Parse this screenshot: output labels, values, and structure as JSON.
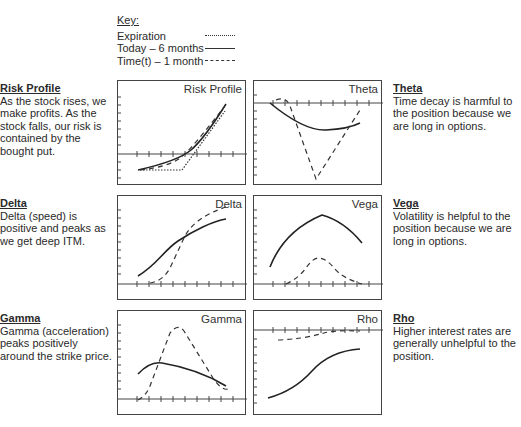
{
  "key": {
    "title": "Key:",
    "items": [
      {
        "label": "Expiration",
        "style": "dotted"
      },
      {
        "label": "Today – 6 months",
        "style": "solid"
      },
      {
        "label": "Time(t) – 1 month",
        "style": "dashed"
      }
    ]
  },
  "descriptions": {
    "risk_profile": {
      "title": "Risk Profile",
      "text": "As the stock rises, we make profits. As the stock falls, our risk is contained by the bought put."
    },
    "delta": {
      "title": "Delta",
      "text": "Delta (speed) is positive and peaks as we get deep ITM."
    },
    "gamma": {
      "title": "Gamma",
      "text": "Gamma (acceleration) peaks positively around the strike price."
    },
    "theta": {
      "title": "Theta",
      "text": "Time decay is harmful to the position because we are long in options."
    },
    "vega": {
      "title": "Vega",
      "text": "Volatility is helpful to the position because we are long in options."
    },
    "rho": {
      "title": "Rho",
      "text": "Higher interest rates are generally unhelpful to the position."
    }
  },
  "panels": {
    "risk_profile": {
      "label": "Risk Profile"
    },
    "theta": {
      "label": "Theta"
    },
    "delta": {
      "label": "Delta"
    },
    "vega": {
      "label": "Vega"
    },
    "gamma": {
      "label": "Gamma"
    },
    "rho": {
      "label": "Rho"
    }
  },
  "colors": {
    "line": "#333333",
    "border": "#444444",
    "text": "#2a2a2a"
  }
}
